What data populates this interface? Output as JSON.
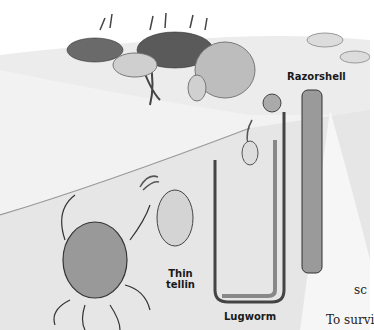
{
  "illustration": {
    "subject": "seashore-burrowing-animals",
    "labels": {
      "razorshell": "Razorshell",
      "thin_tellin_line1": "Thin",
      "thin_tellin_line2": "tellin",
      "lugworm": "Lugworm"
    }
  },
  "body_text": {
    "fragment1": "sc",
    "fragment2": "To survi"
  },
  "colors": {
    "background": "#ffffff",
    "sand": "#e4e4e4",
    "ink": "#1a1a1a"
  }
}
